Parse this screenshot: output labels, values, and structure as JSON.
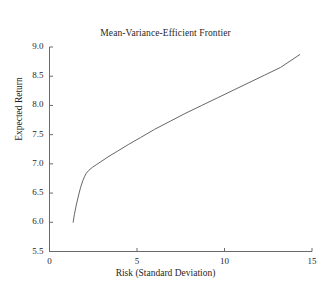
{
  "chart_data": {
    "type": "line",
    "title": "Mean-Variance-Efficient Frontier",
    "xlabel": "Risk (Standard Deviation)",
    "ylabel": "Expected Return",
    "xlim": [
      0,
      15
    ],
    "ylim": [
      5.5,
      9.0
    ],
    "xticks": [
      0,
      5,
      10,
      15
    ],
    "xtick_labels": [
      "0",
      "5",
      "10",
      "15"
    ],
    "yticks": [
      5.5,
      6.0,
      6.5,
      7.0,
      7.5,
      8.0,
      8.5,
      9.0
    ],
    "ytick_labels": [
      "5.5",
      "6.0",
      "6.5",
      "7.0",
      "7.5",
      "8.0",
      "8.5",
      "9.0"
    ],
    "grid": false,
    "legend": false,
    "line_color": "#555555",
    "series": [
      {
        "name": "Efficient Frontier",
        "x": [
          1.35,
          1.42,
          1.52,
          1.65,
          1.78,
          1.9,
          2.0,
          2.1,
          2.25,
          2.45,
          2.7,
          3.0,
          3.4,
          3.9,
          4.5,
          5.2,
          6.0,
          6.9,
          7.8,
          8.7,
          9.6,
          10.5,
          11.4,
          12.3,
          13.2,
          14.3
        ],
        "y": [
          6.0,
          6.13,
          6.28,
          6.45,
          6.6,
          6.71,
          6.78,
          6.84,
          6.89,
          6.94,
          6.99,
          7.05,
          7.13,
          7.22,
          7.33,
          7.45,
          7.59,
          7.73,
          7.87,
          8.0,
          8.13,
          8.26,
          8.39,
          8.52,
          8.65,
          8.87
        ]
      }
    ]
  },
  "axes": {
    "tick_direction": "in",
    "spines": [
      "left",
      "bottom"
    ]
  }
}
